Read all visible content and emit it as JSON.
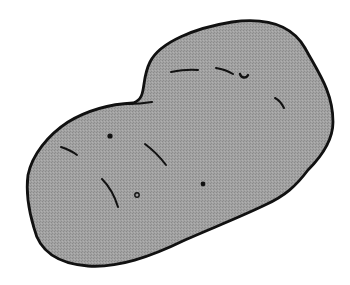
{
  "image": {
    "subject": "potato illustration",
    "colors": {
      "background": "#ffffff",
      "fill": "#9b9b9b",
      "outline": "#111111"
    },
    "marks": {
      "dots": [
        {
          "cx": 110,
          "cy": 136,
          "r": 2.6,
          "filled": true
        },
        {
          "cx": 203,
          "cy": 184,
          "r": 2.4,
          "filled": true
        },
        {
          "cx": 137,
          "cy": 195,
          "r": 2.2,
          "filled": false
        }
      ]
    }
  }
}
